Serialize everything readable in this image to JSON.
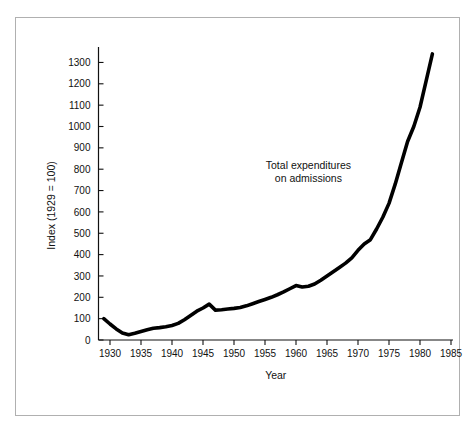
{
  "chart_data": {
    "type": "line",
    "title": "",
    "subtitle": "",
    "xlabel": "Year",
    "ylabel": "Index (1929 = 100)",
    "xlim": [
      1928,
      1986
    ],
    "ylim": [
      0,
      1380
    ],
    "grid": false,
    "legend_position": "none",
    "annotations": [
      {
        "name": "series-annotation",
        "line1": "Total expenditures",
        "line2": "on admissions",
        "x": 1962,
        "y": 800
      }
    ],
    "xticks": [
      1930,
      1935,
      1940,
      1945,
      1950,
      1955,
      1960,
      1965,
      1970,
      1975,
      1980,
      1985
    ],
    "xtick_labels": [
      "1930",
      "1935",
      "1940",
      "1945",
      "1950",
      "1955",
      "1960",
      "1965",
      "1970",
      "1975",
      "1980",
      "1985"
    ],
    "yticks": [
      0,
      100,
      200,
      300,
      400,
      500,
      600,
      700,
      800,
      900,
      1000,
      1100,
      1200,
      1300
    ],
    "ytick_labels": [
      "0",
      "100",
      "200",
      "300",
      "400",
      "500",
      "600",
      "700",
      "800",
      "900",
      "1000",
      "1100",
      "1200",
      "1300"
    ],
    "line_color": "#000000",
    "line_width": 3.6,
    "series": [
      {
        "name": "Total expenditures on admissions",
        "x": [
          1929,
          1930,
          1931,
          1932,
          1933,
          1934,
          1935,
          1936,
          1937,
          1938,
          1939,
          1940,
          1941,
          1942,
          1943,
          1944,
          1945,
          1946,
          1947,
          1948,
          1949,
          1950,
          1951,
          1952,
          1953,
          1954,
          1955,
          1956,
          1957,
          1958,
          1959,
          1960,
          1961,
          1962,
          1963,
          1964,
          1965,
          1966,
          1967,
          1968,
          1969,
          1970,
          1971,
          1972,
          1973,
          1974,
          1975,
          1976,
          1977,
          1978,
          1979,
          1980,
          1981,
          1982
        ],
        "values": [
          100,
          75,
          52,
          33,
          25,
          32,
          40,
          48,
          55,
          58,
          62,
          68,
          78,
          95,
          115,
          135,
          150,
          168,
          140,
          142,
          145,
          148,
          152,
          160,
          170,
          180,
          190,
          200,
          212,
          225,
          240,
          255,
          248,
          252,
          262,
          280,
          300,
          320,
          340,
          360,
          385,
          420,
          450,
          470,
          520,
          575,
          640,
          730,
          830,
          930,
          1000,
          1090,
          1215,
          1340
        ]
      }
    ]
  },
  "axes": {
    "y_axis_name": "y-axis",
    "x_axis_name": "x-axis"
  }
}
